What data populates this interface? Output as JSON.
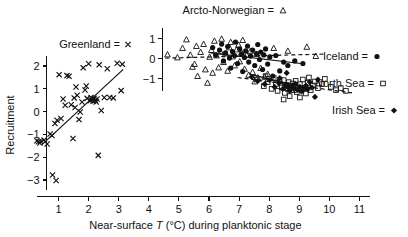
{
  "chart_data": {
    "type": "scatter",
    "title": "",
    "xlabel": "Near-surface T (°C) during planktonic stage",
    "ylabel": "Recruitment",
    "xlim": [
      0.1,
      11.5
    ],
    "ylim": [
      -3.5,
      2.6
    ],
    "xticks": [
      1,
      2,
      3,
      4,
      5,
      6,
      7,
      8,
      9,
      10,
      11
    ],
    "yticks": [
      2,
      1,
      0,
      -1,
      -2,
      -3
    ],
    "grid": false,
    "legend_position": "in-plot annotations",
    "inset_axis": {
      "label": "",
      "ticks": [
        1,
        0,
        -1
      ],
      "x_position": 4.45,
      "note": "secondary vertical recruitment axis for right-hand stocks"
    },
    "legend": [
      {
        "name": "Greenland",
        "symbol": "x",
        "text": "Greenland = x"
      },
      {
        "name": "Arcto-Norwegian",
        "symbol": "open-triangle",
        "text": "Arcto-Norwegian ="
      },
      {
        "name": "Iceland",
        "symbol": "filled-circle",
        "text": "Iceland ="
      },
      {
        "name": "North Sea",
        "symbol": "open-square",
        "text": "North Sea ="
      },
      {
        "name": "Irish Sea",
        "symbol": "filled-diamond",
        "text": "Irish Sea ="
      }
    ],
    "series": [
      {
        "name": "Greenland",
        "symbol": "x",
        "axis": "left",
        "trend": {
          "style": "solid",
          "x1": 0.45,
          "y1": -1.45,
          "x2": 3.15,
          "y2": 1.85
        },
        "points": [
          [
            0.28,
            -1.28
          ],
          [
            0.33,
            -1.32
          ],
          [
            0.4,
            -1.3
          ],
          [
            0.38,
            -1.38
          ],
          [
            0.52,
            -1.25
          ],
          [
            0.62,
            -1.42
          ],
          [
            0.72,
            -0.98
          ],
          [
            0.78,
            -1.05
          ],
          [
            0.8,
            -2.78
          ],
          [
            0.92,
            -3.02
          ],
          [
            0.88,
            -0.52
          ],
          [
            0.95,
            -0.38
          ],
          [
            1.02,
            1.62
          ],
          [
            1.08,
            -0.3
          ],
          [
            1.15,
            0.55
          ],
          [
            1.22,
            0.28
          ],
          [
            1.28,
            1.58
          ],
          [
            1.35,
            1.55
          ],
          [
            1.42,
            0.3
          ],
          [
            1.48,
            -1.18
          ],
          [
            1.52,
            0.6
          ],
          [
            1.55,
            0.18
          ],
          [
            1.58,
            1.08
          ],
          [
            1.62,
            0.72
          ],
          [
            1.68,
            -0.35
          ],
          [
            1.72,
            -0.02
          ],
          [
            1.78,
            0.42
          ],
          [
            1.82,
            1.92
          ],
          [
            1.88,
            0.95
          ],
          [
            1.92,
            1.12
          ],
          [
            1.95,
            0.58
          ],
          [
            2.0,
            2.1
          ],
          [
            2.05,
            0.48
          ],
          [
            2.08,
            0.62
          ],
          [
            2.12,
            0.52
          ],
          [
            2.15,
            0.45
          ],
          [
            2.18,
            0.58
          ],
          [
            2.22,
            0.5
          ],
          [
            2.25,
            0.42
          ],
          [
            2.28,
            0.55
          ],
          [
            2.32,
            -1.92
          ],
          [
            2.35,
            2.05
          ],
          [
            2.42,
            0.05
          ],
          [
            2.52,
            0.62
          ],
          [
            2.62,
            1.88
          ],
          [
            2.7,
            0.62
          ],
          [
            2.82,
            0.6
          ],
          [
            2.95,
            2.12
          ],
          [
            3.08,
            0.92
          ],
          [
            3.12,
            2.08
          ]
        ]
      },
      {
        "name": "Arcto-Norwegian",
        "symbol": "open-triangle",
        "axis": "right",
        "trend": {
          "style": "dashed",
          "x1": 4.55,
          "y1": 0.02,
          "x2": 9.85,
          "y2": 0.22
        },
        "points": [
          [
            4.62,
            0.2
          ],
          [
            4.95,
            0.05
          ],
          [
            5.12,
            0.52
          ],
          [
            5.25,
            0.95
          ],
          [
            5.38,
            0.18
          ],
          [
            5.45,
            -0.42
          ],
          [
            5.52,
            -0.28
          ],
          [
            5.58,
            0.62
          ],
          [
            5.62,
            -0.88
          ],
          [
            5.72,
            0.32
          ],
          [
            5.82,
            0.72
          ],
          [
            5.88,
            -0.55
          ],
          [
            5.95,
            -1.22
          ],
          [
            6.02,
            0.08
          ],
          [
            6.08,
            0.42
          ],
          [
            6.12,
            -0.72
          ],
          [
            6.18,
            0.88
          ],
          [
            6.25,
            0.15
          ],
          [
            6.32,
            -0.45
          ],
          [
            6.38,
            0.35
          ],
          [
            6.42,
            0.98
          ],
          [
            6.48,
            -0.18
          ],
          [
            6.55,
            0.25
          ],
          [
            6.62,
            -0.62
          ],
          [
            6.68,
            0.55
          ],
          [
            6.72,
            0.82
          ],
          [
            6.78,
            0.1
          ],
          [
            6.85,
            -0.35
          ],
          [
            6.92,
            0.45
          ],
          [
            6.98,
            0.68
          ],
          [
            7.02,
            -0.15
          ],
          [
            7.08,
            0.3
          ],
          [
            7.12,
            0.92
          ],
          [
            7.18,
            -0.52
          ],
          [
            7.25,
            0.18
          ],
          [
            7.32,
            -0.82
          ],
          [
            7.38,
            0.38
          ],
          [
            7.45,
            -0.68
          ],
          [
            7.52,
            -1.15
          ],
          [
            7.58,
            0.22
          ],
          [
            7.62,
            -0.95
          ],
          [
            7.72,
            -0.48
          ],
          [
            7.85,
            -0.92
          ],
          [
            7.95,
            -0.78
          ],
          [
            8.15,
            0.52
          ],
          [
            8.62,
            0.38
          ],
          [
            9.25,
            0.58
          ],
          [
            9.55,
            0.12
          ]
        ]
      },
      {
        "name": "Iceland",
        "symbol": "filled-circle",
        "axis": "right",
        "trend": {
          "style": "solid",
          "x1": 6.05,
          "y1": 0.28,
          "x2": 9.05,
          "y2": -0.25
        },
        "points": [
          [
            6.12,
            0.55
          ],
          [
            6.22,
            0.18
          ],
          [
            6.35,
            0.42
          ],
          [
            6.42,
            0.72
          ],
          [
            6.48,
            -0.12
          ],
          [
            6.55,
            0.28
          ],
          [
            6.62,
            0.6
          ],
          [
            6.68,
            0.02
          ],
          [
            6.72,
            -0.48
          ],
          [
            6.78,
            0.35
          ],
          [
            6.85,
            0.15
          ],
          [
            6.88,
            0.82
          ],
          [
            6.95,
            -0.25
          ],
          [
            7.02,
            0.48
          ],
          [
            7.08,
            0.22
          ],
          [
            7.12,
            -0.65
          ],
          [
            7.18,
            0.05
          ],
          [
            7.22,
            0.38
          ],
          [
            7.28,
            0.62
          ],
          [
            7.32,
            -0.18
          ],
          [
            7.38,
            0.12
          ],
          [
            7.45,
            0.42
          ],
          [
            7.52,
            -0.35
          ],
          [
            7.58,
            0.25
          ],
          [
            7.62,
            0.7
          ],
          [
            7.68,
            -0.05
          ],
          [
            7.72,
            0.32
          ],
          [
            7.78,
            -0.55
          ],
          [
            7.82,
            0.18
          ],
          [
            7.88,
            0.48
          ],
          [
            7.95,
            -0.28
          ],
          [
            8.02,
            0.08
          ],
          [
            8.12,
            -0.88
          ],
          [
            8.22,
            0.15
          ],
          [
            8.35,
            -0.62
          ],
          [
            8.48,
            -0.18
          ],
          [
            8.62,
            -0.35
          ],
          [
            8.85,
            -0.12
          ],
          [
            9.12,
            -0.25
          ]
        ]
      },
      {
        "name": "North Sea",
        "symbol": "open-square",
        "axis": "right",
        "trend": {
          "style": "dashed",
          "x1": 6.95,
          "y1": -0.95,
          "x2": 10.75,
          "y2": -1.72
        },
        "points": [
          [
            7.58,
            -1.05
          ],
          [
            7.82,
            -1.38
          ],
          [
            7.95,
            -1.18
          ],
          [
            8.08,
            -1.52
          ],
          [
            8.15,
            -0.98
          ],
          [
            8.22,
            -1.28
          ],
          [
            8.28,
            -1.62
          ],
          [
            8.35,
            -1.15
          ],
          [
            8.42,
            -1.45
          ],
          [
            8.48,
            -1.08
          ],
          [
            8.52,
            -1.72
          ],
          [
            8.58,
            -1.32
          ],
          [
            8.62,
            -1.52
          ],
          [
            8.65,
            -1.18
          ],
          [
            8.68,
            -1.88
          ],
          [
            8.72,
            -1.42
          ],
          [
            8.78,
            -1.25
          ],
          [
            8.82,
            -1.58
          ],
          [
            8.85,
            -1.35
          ],
          [
            8.88,
            -1.12
          ],
          [
            8.92,
            -1.68
          ],
          [
            8.95,
            -1.45
          ],
          [
            9.02,
            -1.28
          ],
          [
            9.08,
            -1.55
          ],
          [
            9.12,
            -1.05
          ],
          [
            9.18,
            -1.48
          ],
          [
            9.22,
            -1.75
          ],
          [
            9.28,
            -1.22
          ],
          [
            9.32,
            -0.95
          ],
          [
            9.38,
            -1.58
          ],
          [
            9.45,
            -1.35
          ],
          [
            9.52,
            -1.15
          ],
          [
            9.62,
            -1.48
          ],
          [
            9.75,
            -1.28
          ],
          [
            9.85,
            -1.02
          ],
          [
            10.05,
            -1.42
          ],
          [
            10.22,
            -1.58
          ],
          [
            10.38,
            -1.48
          ],
          [
            10.55,
            -1.62
          ],
          [
            8.48,
            -2.05
          ],
          [
            9.02,
            -1.95
          ],
          [
            7.88,
            -0.88
          ]
        ]
      },
      {
        "name": "Irish Sea",
        "symbol": "filled-diamond",
        "axis": "right",
        "trend": {
          "style": "solid",
          "x1": 7.35,
          "y1": -0.78,
          "x2": 9.35,
          "y2": -1.52
        },
        "points": [
          [
            7.42,
            -0.92
          ],
          [
            7.62,
            -1.12
          ],
          [
            7.85,
            -1.28
          ],
          [
            8.02,
            -1.08
          ],
          [
            8.18,
            -1.42
          ],
          [
            8.32,
            -1.22
          ],
          [
            8.45,
            -1.52
          ],
          [
            8.52,
            -1.32
          ],
          [
            8.62,
            -1.45
          ],
          [
            8.68,
            -1.62
          ],
          [
            8.75,
            -1.38
          ],
          [
            8.82,
            -1.52
          ],
          [
            8.88,
            -1.28
          ],
          [
            8.95,
            -1.58
          ],
          [
            9.02,
            -1.42
          ],
          [
            9.08,
            -1.65
          ],
          [
            9.15,
            -1.48
          ],
          [
            9.22,
            -1.35
          ],
          [
            9.28,
            -1.55
          ],
          [
            9.35,
            -1.18
          ],
          [
            9.42,
            -1.45
          ],
          [
            9.52,
            -1.92
          ],
          [
            9.62,
            -1.05
          ],
          [
            8.35,
            -0.98
          ],
          [
            8.58,
            -0.72
          ]
        ]
      }
    ]
  },
  "axes": {
    "y_title": "Recruitment",
    "x_title_part1": "Near-surface ",
    "x_title_italic": "T",
    "x_title_part2": " (°C) during planktonic stage",
    "x_tick_labels": [
      "1",
      "2",
      "3",
      "4",
      "5",
      "6",
      "7",
      "8",
      "9",
      "10",
      "11"
    ],
    "y_tick_labels": [
      "2",
      "1",
      "0",
      "−1",
      "−2",
      "−3"
    ],
    "inset_tick_labels": [
      "1",
      "0",
      "−1"
    ]
  },
  "annotations": {
    "greenland": "Greenland =",
    "arcto_norwegian": "Arcto-Norwegian =",
    "iceland": "Iceland =",
    "north_sea": "North Sea =",
    "irish_sea": "Irish Sea ="
  },
  "colors": {
    "ink": "#111111",
    "background": "#ffffff"
  }
}
